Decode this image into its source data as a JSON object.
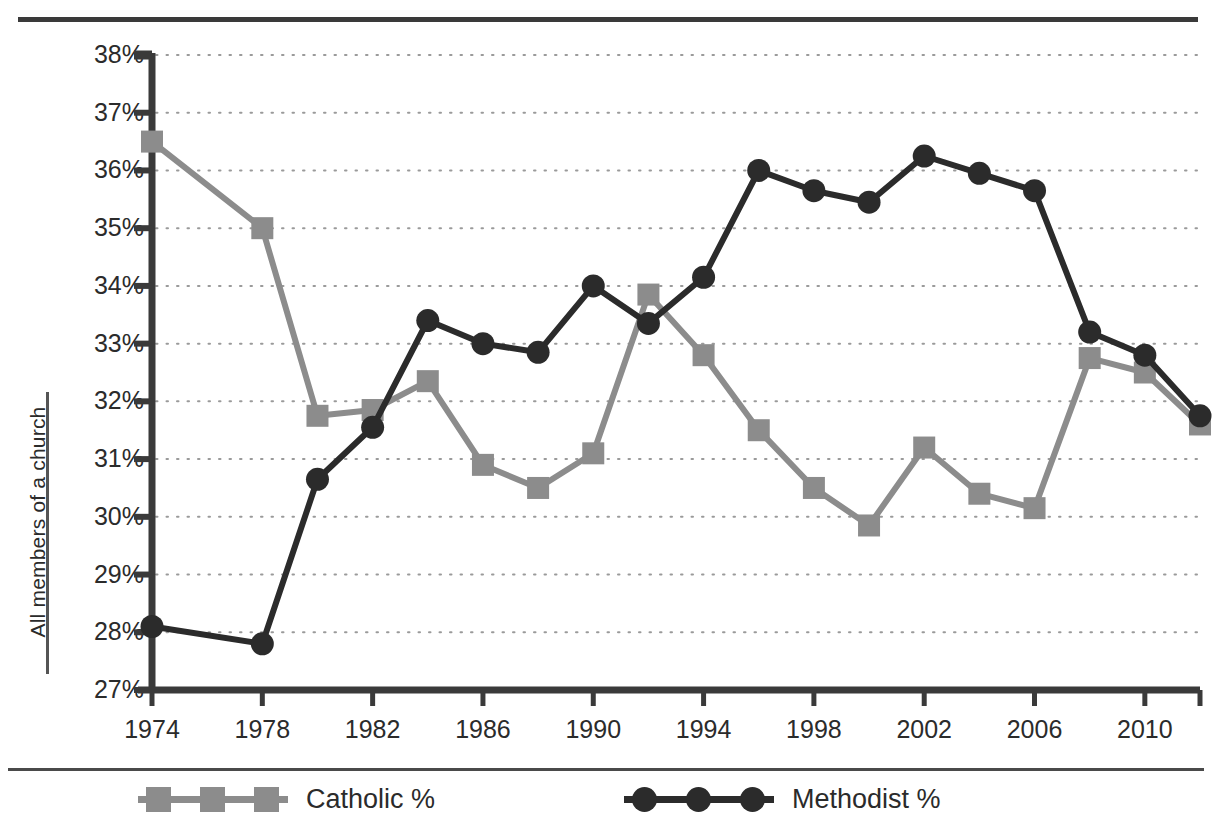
{
  "chart_data": {
    "type": "line",
    "title": "",
    "subtitle": "",
    "xlabel": "",
    "ylabel": "All members of a church",
    "x": [
      1974,
      1978,
      1980,
      1982,
      1984,
      1986,
      1988,
      1990,
      1992,
      1994,
      1996,
      1998,
      2000,
      2002,
      2004,
      2006,
      2008,
      2010,
      2012
    ],
    "xlim": [
      1974,
      2012
    ],
    "ylim": [
      27,
      38
    ],
    "y_tick_labels": [
      "38%",
      "37%",
      "36%",
      "35%",
      "34%",
      "33%",
      "32%",
      "31%",
      "30%",
      "29%",
      "28%",
      "27%"
    ],
    "y_tick_values": [
      38,
      37,
      36,
      35,
      34,
      33,
      32,
      31,
      30,
      29,
      28,
      27
    ],
    "x_tick_labels": [
      "1974",
      "1978",
      "1982",
      "1986",
      "1990",
      "1994",
      "1998",
      "2002",
      "2006",
      "2010"
    ],
    "x_tick_values": [
      1974,
      1978,
      1982,
      1986,
      1990,
      1994,
      1998,
      2002,
      2006,
      2010
    ],
    "grid": "horizontal-dotted",
    "legend_position": "bottom",
    "series": [
      {
        "name": "Catholic %",
        "color": "#8c8c8c",
        "marker": "square",
        "values": [
          36.5,
          35.0,
          31.75,
          31.85,
          32.35,
          30.9,
          30.5,
          31.1,
          33.85,
          32.8,
          31.5,
          30.5,
          29.85,
          31.2,
          30.4,
          30.15,
          32.75,
          32.5,
          31.6
        ]
      },
      {
        "name": "Methodist %",
        "color": "#2b2b2b",
        "marker": "circle",
        "values": [
          28.1,
          27.8,
          30.65,
          31.55,
          33.4,
          33.0,
          32.85,
          34.0,
          33.35,
          34.15,
          36.0,
          35.65,
          35.45,
          36.25,
          35.95,
          35.65,
          33.2,
          32.8,
          31.75
        ]
      }
    ]
  },
  "legend": {
    "entries": [
      {
        "label": "Catholic %"
      },
      {
        "label": "Methodist %"
      }
    ]
  },
  "colors": {
    "catholic": "#8c8c8c",
    "methodist": "#2b2b2b",
    "axis": "#3a3a3a",
    "grid": "#9a9a9a",
    "background": "#ffffff"
  }
}
